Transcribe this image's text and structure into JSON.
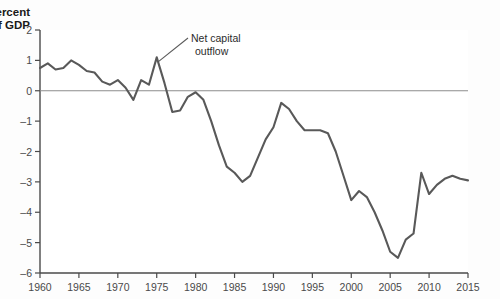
{
  "figure": {
    "background": "#fdfdfd",
    "plot_background": "#ffffff"
  },
  "labels": {
    "y_axis_line1": "Percent",
    "y_axis_line2": "of GDP",
    "annotation_line1": "Net capital",
    "annotation_line2": "outflow"
  },
  "colors": {
    "series": "#595959",
    "axis": "#4a4a4a",
    "zero_line": "#8c8c8c",
    "text": "#2b2b2b",
    "tick_text": "#4a4a4a"
  },
  "chart_data": {
    "type": "line",
    "title": "",
    "xlabel": "",
    "ylabel": "Percent of GDP",
    "xlim": [
      1960,
      2015
    ],
    "ylim": [
      -6,
      2
    ],
    "yticks": [
      2,
      1,
      0,
      -1,
      -2,
      -3,
      -4,
      -5,
      -6
    ],
    "ytick_labels": [
      "2",
      "1",
      "0",
      "–1",
      "–2",
      "–3",
      "–4",
      "–5",
      "–6"
    ],
    "xticks": [
      1960,
      1965,
      1970,
      1975,
      1980,
      1985,
      1990,
      1995,
      2000,
      2005,
      2010,
      2015
    ],
    "xtick_labels": [
      "1960",
      "1965",
      "1970",
      "1975",
      "1980",
      "1985",
      "1990",
      "1995",
      "2000",
      "2005",
      "2010",
      "2015"
    ],
    "grid": false,
    "legend": null,
    "zero_reference_line": 0,
    "annotations": [
      {
        "text": "Net capital outflow",
        "points_to_x": 1975,
        "points_to_y": 1.1
      }
    ],
    "series": [
      {
        "name": "Net capital outflow",
        "x": [
          1960,
          1961,
          1962,
          1963,
          1964,
          1965,
          1966,
          1967,
          1968,
          1969,
          1970,
          1971,
          1972,
          1973,
          1974,
          1975,
          1976,
          1977,
          1978,
          1979,
          1980,
          1981,
          1982,
          1983,
          1984,
          1985,
          1986,
          1987,
          1988,
          1989,
          1990,
          1991,
          1992,
          1993,
          1994,
          1995,
          1996,
          1997,
          1998,
          1999,
          2000,
          2001,
          2002,
          2003,
          2004,
          2005,
          2006,
          2007,
          2008,
          2009,
          2010,
          2011,
          2012,
          2013,
          2014,
          2015
        ],
        "values": [
          0.75,
          0.9,
          0.7,
          0.75,
          1.0,
          0.85,
          0.65,
          0.6,
          0.3,
          0.2,
          0.35,
          0.1,
          -0.3,
          0.35,
          0.2,
          1.1,
          0.25,
          -0.7,
          -0.65,
          -0.2,
          -0.05,
          -0.3,
          -1.0,
          -1.8,
          -2.5,
          -2.7,
          -3.0,
          -2.8,
          -2.2,
          -1.6,
          -1.2,
          -0.4,
          -0.6,
          -1.0,
          -1.3,
          -1.3,
          -1.3,
          -1.4,
          -2.0,
          -2.8,
          -3.6,
          -3.3,
          -3.5,
          -4.0,
          -4.6,
          -5.3,
          -5.5,
          -4.9,
          -4.7,
          -2.7,
          -3.4,
          -3.1,
          -2.9,
          -2.8,
          -2.9,
          -2.95
        ]
      }
    ]
  }
}
